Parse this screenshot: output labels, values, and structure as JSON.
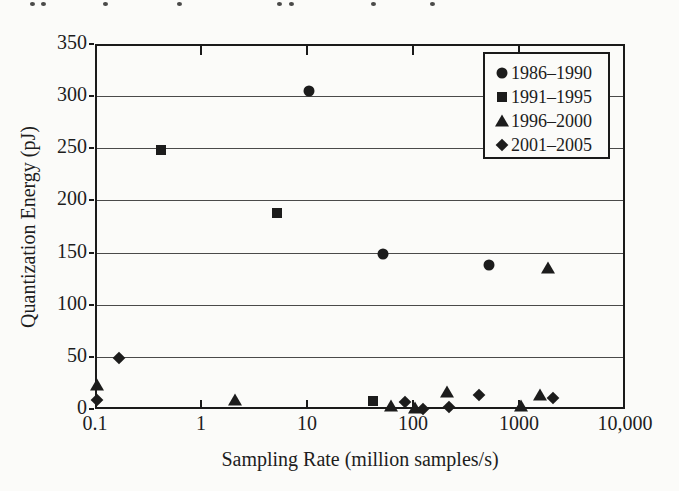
{
  "figure": {
    "background": "#fbfbf9",
    "ink": "#1d1d1d",
    "marker_color": "#1c1c1c",
    "gridline_color": "#4a4a4a"
  },
  "cropped_caption": {
    "description": "bottom tips of a cropped text line at the very top edge",
    "marks_x": [
      30,
      41,
      103,
      177,
      277,
      289,
      371,
      430
    ]
  },
  "chart_data": {
    "type": "scatter",
    "title": "",
    "xlabel": "Sampling Rate (million samples/s)",
    "ylabel": "Quantization Energy (pJ)",
    "x_scale": "log",
    "y_scale": "linear",
    "xlim": [
      0.1,
      10000
    ],
    "ylim": [
      0,
      350
    ],
    "grid": "horizontal",
    "legend_position": "top-right",
    "x_ticks": [
      {
        "value": 0.1,
        "label": "0.1"
      },
      {
        "value": 1,
        "label": "1"
      },
      {
        "value": 10,
        "label": "10"
      },
      {
        "value": 100,
        "label": "100"
      },
      {
        "value": 1000,
        "label": "1000"
      },
      {
        "value": 10000,
        "label": "10,000"
      }
    ],
    "x_minor_axis_ticks": [
      1,
      10,
      100,
      1000
    ],
    "y_ticks": [
      {
        "value": 0,
        "label": "0"
      },
      {
        "value": 50,
        "label": "50"
      },
      {
        "value": 100,
        "label": "100"
      },
      {
        "value": 150,
        "label": "150"
      },
      {
        "value": 200,
        "label": "200"
      },
      {
        "value": 250,
        "label": "250"
      },
      {
        "value": 300,
        "label": "300"
      },
      {
        "value": 350,
        "label": "350"
      }
    ],
    "series": [
      {
        "name": "1986–1990",
        "marker": "circle",
        "points": [
          [
            10,
            307
          ],
          [
            50,
            151
          ],
          [
            500,
            140
          ]
        ]
      },
      {
        "name": "1991–1995",
        "marker": "square",
        "points": [
          [
            0.4,
            250
          ],
          [
            5,
            190
          ],
          [
            40,
            10
          ]
        ]
      },
      {
        "name": "1996–2000",
        "marker": "triangle",
        "points": [
          [
            0.1,
            25
          ],
          [
            2,
            11
          ],
          [
            60,
            5
          ],
          [
            100,
            3
          ],
          [
            200,
            18
          ],
          [
            1000,
            5
          ],
          [
            1500,
            15
          ],
          [
            1800,
            137
          ]
        ]
      },
      {
        "name": "2001–2005",
        "marker": "diamond",
        "points": [
          [
            0.1,
            11
          ],
          [
            0.16,
            51
          ],
          [
            80,
            9
          ],
          [
            120,
            2
          ],
          [
            210,
            4
          ],
          [
            400,
            15
          ],
          [
            2000,
            12
          ]
        ]
      }
    ]
  }
}
